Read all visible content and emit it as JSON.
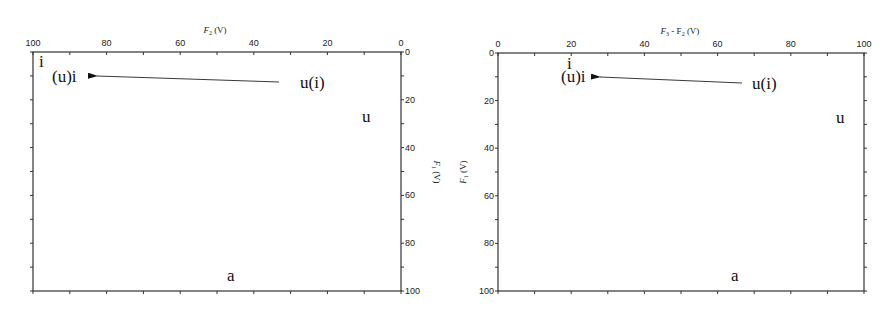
{
  "panels": [
    {
      "id": "left",
      "top_axis": {
        "title_main": "F",
        "title_sub": "2",
        "title_unit": " (V)",
        "ticks": [
          "100",
          "80",
          "60",
          "40",
          "20",
          "0"
        ],
        "direction": "descending"
      },
      "side_axis": {
        "position": "right",
        "title_main": "F",
        "title_sub": "1",
        "title_unit": " (V)",
        "ticks": [
          "0",
          "20",
          "40",
          "60",
          "80",
          "100"
        ],
        "title_rotation": "top-to-bottom"
      },
      "annotations": {
        "corner": "i",
        "target": "(u)i",
        "source": "u(i)",
        "right_mid": "u",
        "bottom": "a"
      }
    },
    {
      "id": "right",
      "top_axis": {
        "title_main": "F",
        "title_sub": "3",
        "title_rest": " - F",
        "title_sub2": "2",
        "title_unit": " (V)",
        "ticks": [
          "0",
          "20",
          "40",
          "60",
          "80",
          "100"
        ],
        "direction": "ascending"
      },
      "side_axis": {
        "position": "left",
        "title_main": "F",
        "title_sub": "1",
        "title_unit": " (V)",
        "ticks": [
          "0",
          "20",
          "40",
          "60",
          "80",
          "100"
        ],
        "title_rotation": "bottom-to-top"
      },
      "annotations": {
        "corner": "i",
        "target": "(u)i",
        "source": "u(i)",
        "right_mid": "u",
        "bottom": "a"
      }
    }
  ]
}
